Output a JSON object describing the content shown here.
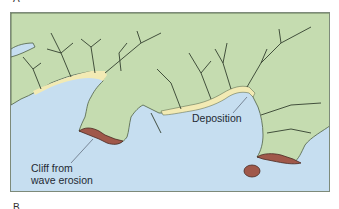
{
  "figure": {
    "panel_letter_top": "A",
    "panel_letter_bottom": "B",
    "labels": {
      "cliff_line1": "Cliff from",
      "cliff_line2": "wave erosion",
      "deposition": "Deposition"
    },
    "colors": {
      "land": "#c5dcb0",
      "water": "#c6def0",
      "beach": "#f2eab4",
      "cliff": "#a0584a",
      "stream": "#33402f",
      "frame": "#7d8a7a"
    }
  }
}
